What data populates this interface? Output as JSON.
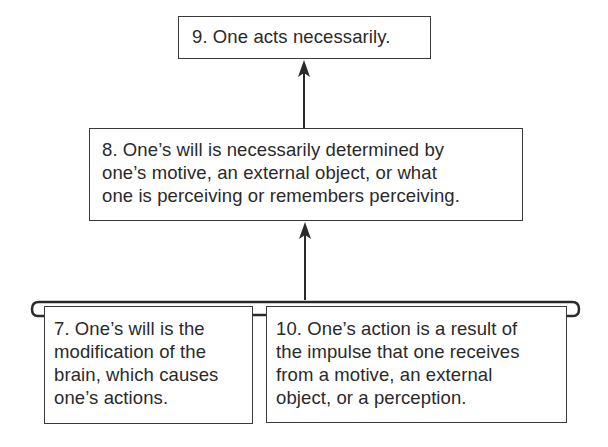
{
  "diagram": {
    "type": "argument-map",
    "nodes": [
      {
        "id": "9",
        "lines": [
          "9. One acts necessarily."
        ]
      },
      {
        "id": "8",
        "lines": [
          "8. One’s will is necessarily determined by",
          "one’s motive, an external object, or what",
          "one is perceiving or remembers perceiving."
        ]
      },
      {
        "id": "7",
        "lines": [
          "7. One’s will is the",
          "modification of the",
          "brain, which causes",
          "one’s actions."
        ]
      },
      {
        "id": "10",
        "lines": [
          "10. One’s action is a result of",
          "the impulse that one receives",
          "from a motive, an external",
          "object, or a perception."
        ]
      }
    ],
    "edges": [
      {
        "from": "8",
        "to": "9",
        "kind": "arrow"
      },
      {
        "from": [
          "7",
          "10"
        ],
        "to": "8",
        "kind": "linked-premises-arrow"
      }
    ],
    "colors": {
      "line": "#2a2a2a",
      "text": "#2a2a2a",
      "background": "#ffffff"
    }
  }
}
